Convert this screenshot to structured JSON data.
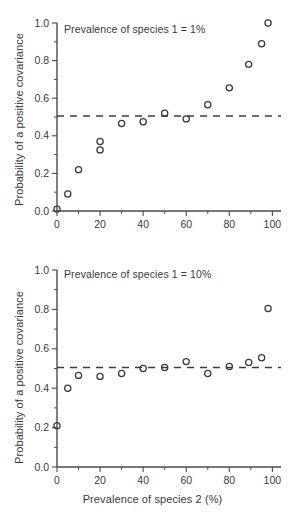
{
  "figure": {
    "xlabel": "Prevalence of species 2 (%)",
    "panels": [
      {
        "id": "top",
        "annotation": "Prevalence of species 1 = 1%",
        "ylabel": "Probability of a positive covariance"
      },
      {
        "id": "bottom",
        "annotation": "Prevalence of species 1 = 10%",
        "ylabel": "Probability of a positive covariance"
      }
    ]
  },
  "chart_data": [
    {
      "type": "scatter",
      "panel": "top",
      "title": "",
      "annotation": "Prevalence of species 1 = 1%",
      "xlabel": "Prevalence of species 2 (%)",
      "ylabel": "Probability of a positive covariance",
      "xlim": [
        0,
        104
      ],
      "ylim": [
        0,
        1.0
      ],
      "xticks": [
        0,
        20,
        40,
        60,
        80,
        100
      ],
      "xticklabels": [
        "0",
        "20",
        "40",
        "60",
        "80",
        "100"
      ],
      "xminorticks": [
        10,
        30,
        50,
        70,
        90
      ],
      "yticks": [
        0.0,
        0.2,
        0.4,
        0.6,
        0.8,
        1.0
      ],
      "yticklabels": [
        "0.0",
        "0.2",
        "0.4",
        "0.6",
        "0.8",
        "1.0"
      ],
      "yminorticks": [
        0.1,
        0.3,
        0.5,
        0.7,
        0.9
      ],
      "grid": false,
      "legend": false,
      "marker": "open-circle",
      "reference_line": {
        "type": "horizontal-dashed",
        "y": 0.505,
        "x_from": 0,
        "x_to": 104
      },
      "x": [
        0,
        5,
        10,
        20,
        20,
        30,
        40,
        50,
        60,
        70,
        80,
        89,
        95,
        98
      ],
      "y": [
        0.01,
        0.09,
        0.22,
        0.325,
        0.37,
        0.465,
        0.475,
        0.52,
        0.49,
        0.565,
        0.655,
        0.78,
        0.89,
        1.0
      ]
    },
    {
      "type": "scatter",
      "panel": "bottom",
      "title": "",
      "annotation": "Prevalence of species 1 = 10%",
      "xlabel": "Prevalence of species 2 (%)",
      "ylabel": "Probability of a positive covariance",
      "xlim": [
        0,
        104
      ],
      "ylim": [
        0,
        1.0
      ],
      "xticks": [
        0,
        20,
        40,
        60,
        80,
        100
      ],
      "xticklabels": [
        "0",
        "20",
        "40",
        "60",
        "80",
        "100"
      ],
      "xminorticks": [
        10,
        30,
        50,
        70,
        90
      ],
      "yticks": [
        0.0,
        0.2,
        0.4,
        0.6,
        0.8,
        1.0
      ],
      "yticklabels": [
        "0.0",
        "0.2",
        "0.4",
        "0.6",
        "0.8",
        "1.0"
      ],
      "yminorticks": [
        0.1,
        0.3,
        0.5,
        0.7,
        0.9
      ],
      "grid": false,
      "legend": false,
      "marker": "open-circle",
      "reference_line": {
        "type": "horizontal-dashed",
        "y": 0.505,
        "x_from": 0,
        "x_to": 104
      },
      "x": [
        0,
        5,
        10,
        20,
        30,
        40,
        50,
        60,
        70,
        80,
        89,
        95,
        98
      ],
      "y": [
        0.21,
        0.4,
        0.465,
        0.46,
        0.475,
        0.5,
        0.505,
        0.535,
        0.475,
        0.51,
        0.53,
        0.555,
        0.805
      ]
    }
  ]
}
